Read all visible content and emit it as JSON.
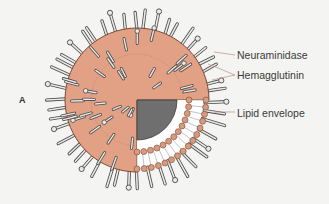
{
  "figure": {
    "panel_letter": "A",
    "labels": [
      {
        "id": "neuraminidase",
        "text": "Neuraminidase",
        "x": 237,
        "y": 50,
        "line_from": [
          214,
          52
        ],
        "line_to": [
          235,
          55
        ]
      },
      {
        "id": "hemagglutinin",
        "text": "Hemagglutinin",
        "x": 237,
        "y": 70,
        "line_from": [
          208,
          64
        ],
        "line_to": [
          235,
          75
        ]
      },
      {
        "id": "lipid-envelope",
        "text": "Lipid envelope",
        "x": 237,
        "y": 108,
        "line_from": [
          214,
          112
        ],
        "line_to": [
          235,
          112
        ]
      }
    ],
    "colors": {
      "envelope_fill": "#e2a185",
      "envelope_stroke": "#7a4a38",
      "core_fill": "#6f6f6f",
      "bilayer_bead": "#d89a7c",
      "spike_fill": "#e9e9e6",
      "spike_stroke": "#4a4a4a",
      "leader_line": "#b89080",
      "background": "#f4f4f2"
    }
  }
}
